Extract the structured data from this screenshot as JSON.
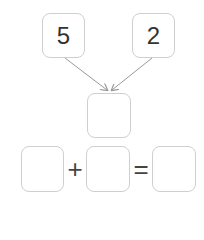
{
  "top_numbers": [
    "5",
    "2"
  ],
  "middle_box": "",
  "equation": {
    "first": "",
    "operator": "+",
    "second": "",
    "equals": "=",
    "result": ""
  },
  "colors": {
    "box_border": "#cfcfcf",
    "arrow": "#999999",
    "text": "#333333"
  }
}
